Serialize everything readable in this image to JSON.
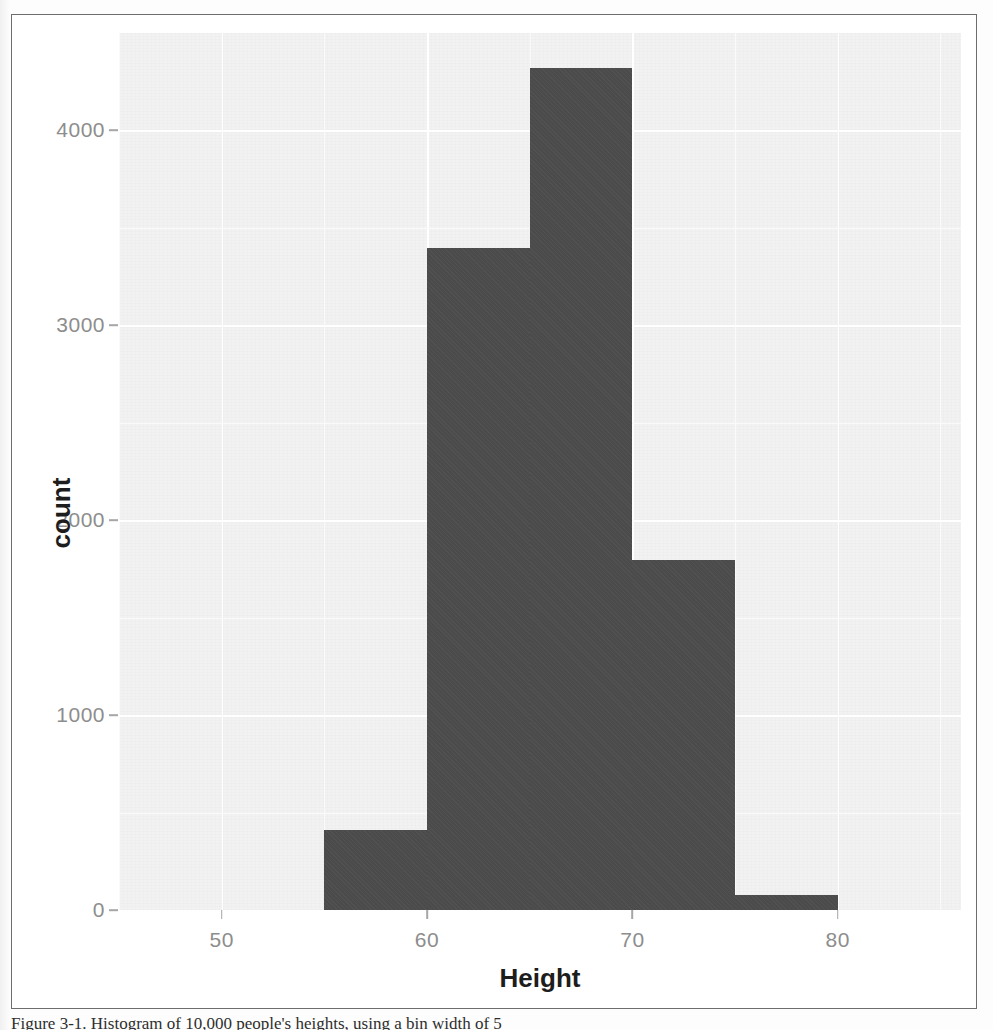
{
  "figure": {
    "caption": "Figure 3-1. Histogram of 10,000 people's heights",
    "caption_visible_fragment": "Figure 3-1. Histogram of 10,000 people's heights, using a bin width of 5"
  },
  "chart_data": {
    "type": "bar",
    "title": "",
    "subtitle": "",
    "xlabel": "Height",
    "ylabel": "count",
    "categories": [
      "55-60",
      "60-65",
      "65-70",
      "70-75",
      "75-80"
    ],
    "bin_width": 5,
    "bin_starts": [
      55,
      60,
      65,
      70,
      75
    ],
    "values": [
      410,
      3395,
      4320,
      1795,
      75
    ],
    "xlim": [
      45,
      86
    ],
    "ylim": [
      0,
      4500
    ],
    "xticks": [
      50,
      60,
      70,
      80
    ],
    "xtick_labels": [
      "50",
      "60",
      "70",
      "80"
    ],
    "yticks": [
      0,
      1000,
      2000,
      3000,
      4000
    ],
    "ytick_labels": [
      "0",
      "1000",
      "2000",
      "3000",
      "4000"
    ],
    "grid": true,
    "legend": "none",
    "bar_color": "#4b4b4b",
    "panel_color": "#f2f2f2",
    "gridline_color": "#ffffff",
    "tick_label_color": "#8d8d8d",
    "axis_title_color": "#1d1d1d"
  }
}
